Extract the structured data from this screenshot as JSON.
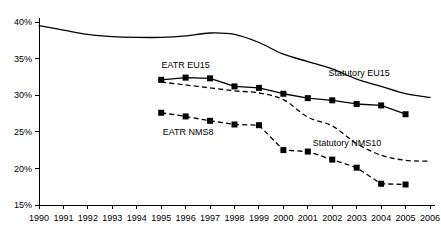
{
  "chart_data": {
    "type": "line",
    "title": "",
    "xlabel": "",
    "ylabel": "",
    "xlim": [
      1990,
      2006
    ],
    "ylim": [
      15,
      40
    ],
    "grid": false,
    "legend": "inline-annotations",
    "x_tick_labels": [
      "1990",
      "1991",
      "1992",
      "1993",
      "1994",
      "1995",
      "1996",
      "1997",
      "1998",
      "1999",
      "2000",
      "2001",
      "2002",
      "2003",
      "2004",
      "2005",
      "2006"
    ],
    "y_tick_labels": [
      "15%",
      "20%",
      "25%",
      "30%",
      "35%",
      "40%"
    ],
    "y_tick_values": [
      15,
      20,
      25,
      30,
      35,
      40
    ],
    "series": [
      {
        "name": "Statutory EU15",
        "style": "solid",
        "markers": false,
        "label_x": 2003.1,
        "label_y": 32.6,
        "x": [
          1990,
          1991,
          1992,
          1993,
          1994,
          1995,
          1996,
          1997,
          1998,
          1999,
          2000,
          2001,
          2002,
          2003,
          2004,
          2005,
          2006
        ],
        "values": [
          39.5,
          38.9,
          38.3,
          38.0,
          37.9,
          37.9,
          38.1,
          38.5,
          38.3,
          37.2,
          35.6,
          34.6,
          33.6,
          32.2,
          31.2,
          30.2,
          29.7
        ]
      },
      {
        "name": "EATR EU15",
        "style": "solid",
        "markers": true,
        "label_x": 1996.0,
        "label_y": 33.7,
        "x": [
          1995,
          1996,
          1997,
          1998,
          1999,
          2000,
          2001,
          2002,
          2003,
          2004,
          2005
        ],
        "values": [
          32.1,
          32.4,
          32.3,
          31.2,
          31.0,
          30.2,
          29.6,
          29.3,
          28.8,
          28.6,
          27.4
        ]
      },
      {
        "name": "Statutory NMS10",
        "style": "dashed",
        "markers": false,
        "label_x": 2002.6,
        "label_y": 23.1,
        "x": [
          1995,
          1996,
          1997,
          1998,
          1999,
          2000,
          2001,
          2002,
          2003,
          2004,
          2005,
          2006
        ],
        "values": [
          31.8,
          31.4,
          31.0,
          30.6,
          30.3,
          29.4,
          27.0,
          25.8,
          23.4,
          21.8,
          21.1,
          21.0
        ]
      },
      {
        "name": "EATR NMS8",
        "style": "dashed",
        "markers": true,
        "label_x": 1996.1,
        "label_y": 24.6,
        "x": [
          1995,
          1996,
          1997,
          1998,
          1999,
          2000,
          2001,
          2002,
          2003,
          2004,
          2005
        ],
        "values": [
          27.6,
          27.1,
          26.5,
          26.0,
          25.9,
          22.5,
          22.3,
          21.2,
          20.1,
          17.9,
          17.8
        ]
      }
    ]
  }
}
